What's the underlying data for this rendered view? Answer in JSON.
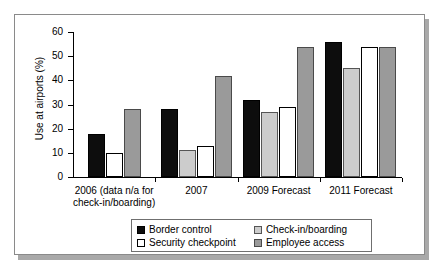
{
  "chart_data": {
    "type": "bar",
    "title": "",
    "xlabel": "",
    "ylabel": "Use at airports (%)",
    "ylim": [
      0,
      60
    ],
    "yticks": [
      0,
      10,
      20,
      30,
      40,
      50,
      60
    ],
    "ytick_labels": [
      "0",
      "10",
      "20",
      "30",
      "40",
      "50",
      "60"
    ],
    "grid": false,
    "legend_position": "bottom",
    "categories": [
      "2006 (data n/a for check-in/boarding)",
      "2007",
      "2009 Forecast",
      "2011 Forecast"
    ],
    "category_lines": [
      [
        "2006 (data n/a for",
        "check-in/boarding)"
      ],
      [
        "2007"
      ],
      [
        "2009 Forecast"
      ],
      [
        "2011 Forecast"
      ]
    ],
    "series": [
      {
        "name": "Border control",
        "color": "#0d0d0d",
        "values": [
          18,
          28,
          32,
          56
        ]
      },
      {
        "name": "Check-in/boarding",
        "color": "#cccccc",
        "values": [
          null,
          11,
          27,
          45
        ]
      },
      {
        "name": "Security checkpoint",
        "color": "#ffffff",
        "values": [
          10,
          13,
          29,
          54
        ]
      },
      {
        "name": "Employee access",
        "color": "#9a9a9a",
        "values": [
          28,
          42,
          54,
          54
        ]
      }
    ]
  },
  "legend": {
    "entries": [
      {
        "label": "Border control",
        "swatch": "black-swatch"
      },
      {
        "label": "Check-in/boarding",
        "swatch": "light-gray-swatch"
      },
      {
        "label": "Security checkpoint",
        "swatch": "white-swatch"
      },
      {
        "label": "Employee access",
        "swatch": "medium-gray-swatch"
      }
    ]
  }
}
